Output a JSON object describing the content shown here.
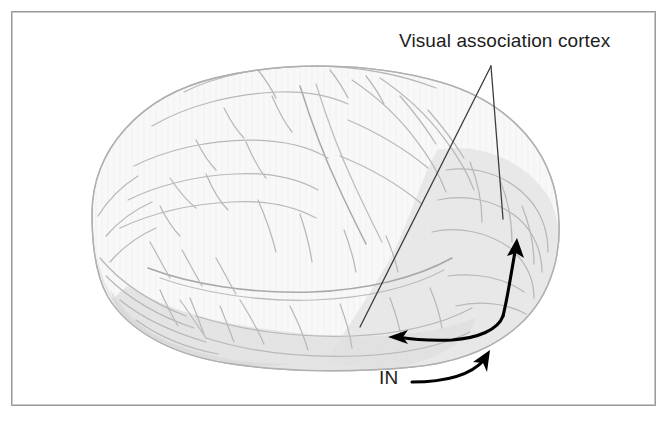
{
  "figure": {
    "type": "anatomical-illustration",
    "background_color": "#ffffff",
    "border_color": "#9a9a9a",
    "brain_outline_color": "#b9b9b9",
    "brain_fill_color": "#f7f7f7",
    "shaded_region_color": "#e0e0e0",
    "annotation_color": "#000000",
    "leader_line_color": "#3a3a3a",
    "labels": {
      "visual_association_cortex": "Visual association cortex",
      "in": "IN"
    },
    "annotations": [
      {
        "name": "visual-association-cortex-leader-left",
        "type": "leader-line",
        "from": [
          491,
          66
        ],
        "to": [
          360,
          327
        ]
      },
      {
        "name": "visual-association-cortex-leader-right",
        "type": "leader-line",
        "from": [
          491,
          66
        ],
        "to": [
          503,
          219
        ]
      },
      {
        "name": "double-headed-pathway-arrow",
        "type": "curved-double-arrow",
        "heads": [
          "up-right",
          "left"
        ],
        "from": [
          513,
          244
        ],
        "to": [
          392,
          337
        ]
      },
      {
        "name": "in-arrow",
        "type": "curved-arrow",
        "head": "up-right",
        "from": [
          413,
          382
        ],
        "to": [
          489,
          351
        ]
      }
    ]
  }
}
